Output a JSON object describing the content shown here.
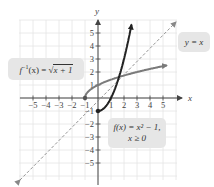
{
  "chart_data": {
    "type": "line",
    "title": "",
    "xlabel": "x",
    "ylabel": "y",
    "xlim": [
      -5.5,
      5.5
    ],
    "ylim": [
      -5.5,
      5.5
    ],
    "grid": true,
    "x_ticks": [
      -5,
      -4,
      -3,
      -2,
      -1,
      1,
      2,
      3,
      4,
      5
    ],
    "y_ticks": [
      5,
      4,
      3,
      2,
      1,
      -1,
      -2,
      -3,
      -4,
      -5
    ],
    "x_tick_labels": [
      "−5",
      "−4",
      "−3",
      "−2",
      "−1",
      "1",
      "2",
      "3",
      "4",
      "5"
    ],
    "y_tick_labels": [
      "5",
      "4",
      "3",
      "2",
      "1",
      "−1",
      "−2",
      "−3",
      "−4",
      "−5"
    ],
    "series": [
      {
        "name": "f(x) = x² − 1, x ≥ 0",
        "style": "solid-dark",
        "color": "#222222",
        "x": [
          0,
          0.5,
          1,
          1.5,
          2,
          2.5
        ],
        "y": [
          -1,
          -0.75,
          0,
          1.25,
          3,
          5.25
        ]
      },
      {
        "name": "f⁻¹(x) = √(x + 1)",
        "style": "solid-gray",
        "color": "#7a7a7a",
        "x": [
          -1,
          0,
          1,
          2,
          3,
          4,
          5
        ],
        "y": [
          0,
          1,
          1.41,
          1.73,
          2,
          2.24,
          2.45
        ]
      },
      {
        "name": "y = x",
        "style": "dashed",
        "color": "#888888",
        "x": [
          -5.5,
          5.5
        ],
        "y": [
          -5.5,
          5.5
        ]
      }
    ],
    "annotations": [
      {
        "text": "f⁻¹(x) = √(x + 1)",
        "position": "upper-left"
      },
      {
        "text": "y = x",
        "position": "upper-right"
      },
      {
        "text": "f(x) = x² − 1, x ≥ 0",
        "position": "lower-right"
      }
    ],
    "points": [
      {
        "x": -1,
        "y": 0,
        "series": "f⁻¹"
      },
      {
        "x": 0,
        "y": -1,
        "series": "f"
      }
    ]
  },
  "labels": {
    "finv_prefix": "f",
    "finv_sup": "−1",
    "finv_mid": "(x) = √",
    "finv_rad": "x + 1",
    "yx": "y = x",
    "f_line1": "f(x) = x² − 1,",
    "f_line2": "x ≥ 0",
    "x_axis": "x",
    "y_axis": "y"
  }
}
